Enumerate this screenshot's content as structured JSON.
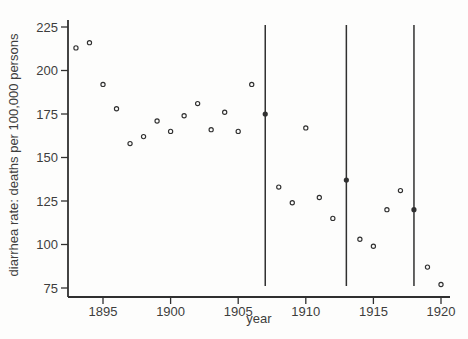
{
  "figure": {
    "background": "#fdfdfc",
    "ink_color": "#303030",
    "label_color": "#3d3d3d"
  },
  "chart_data": {
    "type": "scatter",
    "title": "",
    "xlabel": "year",
    "ylabel": "diarrhea rate: deaths per 100,000 persons",
    "xlim": [
      1892.4,
      1920.7
    ],
    "ylim": [
      75,
      225
    ],
    "x_ticks": [
      1895,
      1900,
      1905,
      1910,
      1915,
      1920
    ],
    "y_ticks": [
      75,
      100,
      125,
      150,
      175,
      200,
      225
    ],
    "grid": false,
    "legend_position": "none",
    "vlines": [
      1907,
      1913,
      1918
    ],
    "points": [
      {
        "year": 1893,
        "rate": 213,
        "filled": false
      },
      {
        "year": 1894,
        "rate": 216,
        "filled": false
      },
      {
        "year": 1895,
        "rate": 192,
        "filled": false
      },
      {
        "year": 1896,
        "rate": 178,
        "filled": false
      },
      {
        "year": 1897,
        "rate": 158,
        "filled": false
      },
      {
        "year": 1898,
        "rate": 162,
        "filled": false
      },
      {
        "year": 1899,
        "rate": 171,
        "filled": false
      },
      {
        "year": 1900,
        "rate": 165,
        "filled": false
      },
      {
        "year": 1901,
        "rate": 174,
        "filled": false
      },
      {
        "year": 1902,
        "rate": 181,
        "filled": false
      },
      {
        "year": 1903,
        "rate": 166,
        "filled": false
      },
      {
        "year": 1904,
        "rate": 176,
        "filled": false
      },
      {
        "year": 1905,
        "rate": 165,
        "filled": false
      },
      {
        "year": 1906,
        "rate": 192,
        "filled": false
      },
      {
        "year": 1907,
        "rate": 175,
        "filled": true
      },
      {
        "year": 1908,
        "rate": 133,
        "filled": false
      },
      {
        "year": 1909,
        "rate": 124,
        "filled": false
      },
      {
        "year": 1910,
        "rate": 167,
        "filled": false
      },
      {
        "year": 1911,
        "rate": 127,
        "filled": false
      },
      {
        "year": 1912,
        "rate": 115,
        "filled": false
      },
      {
        "year": 1913,
        "rate": 137,
        "filled": true
      },
      {
        "year": 1914,
        "rate": 103,
        "filled": false
      },
      {
        "year": 1915,
        "rate": 99,
        "filled": false
      },
      {
        "year": 1916,
        "rate": 120,
        "filled": false
      },
      {
        "year": 1917,
        "rate": 131,
        "filled": false
      },
      {
        "year": 1918,
        "rate": 120,
        "filled": true
      },
      {
        "year": 1919,
        "rate": 87,
        "filled": false
      },
      {
        "year": 1920,
        "rate": 77,
        "filled": false
      }
    ]
  }
}
